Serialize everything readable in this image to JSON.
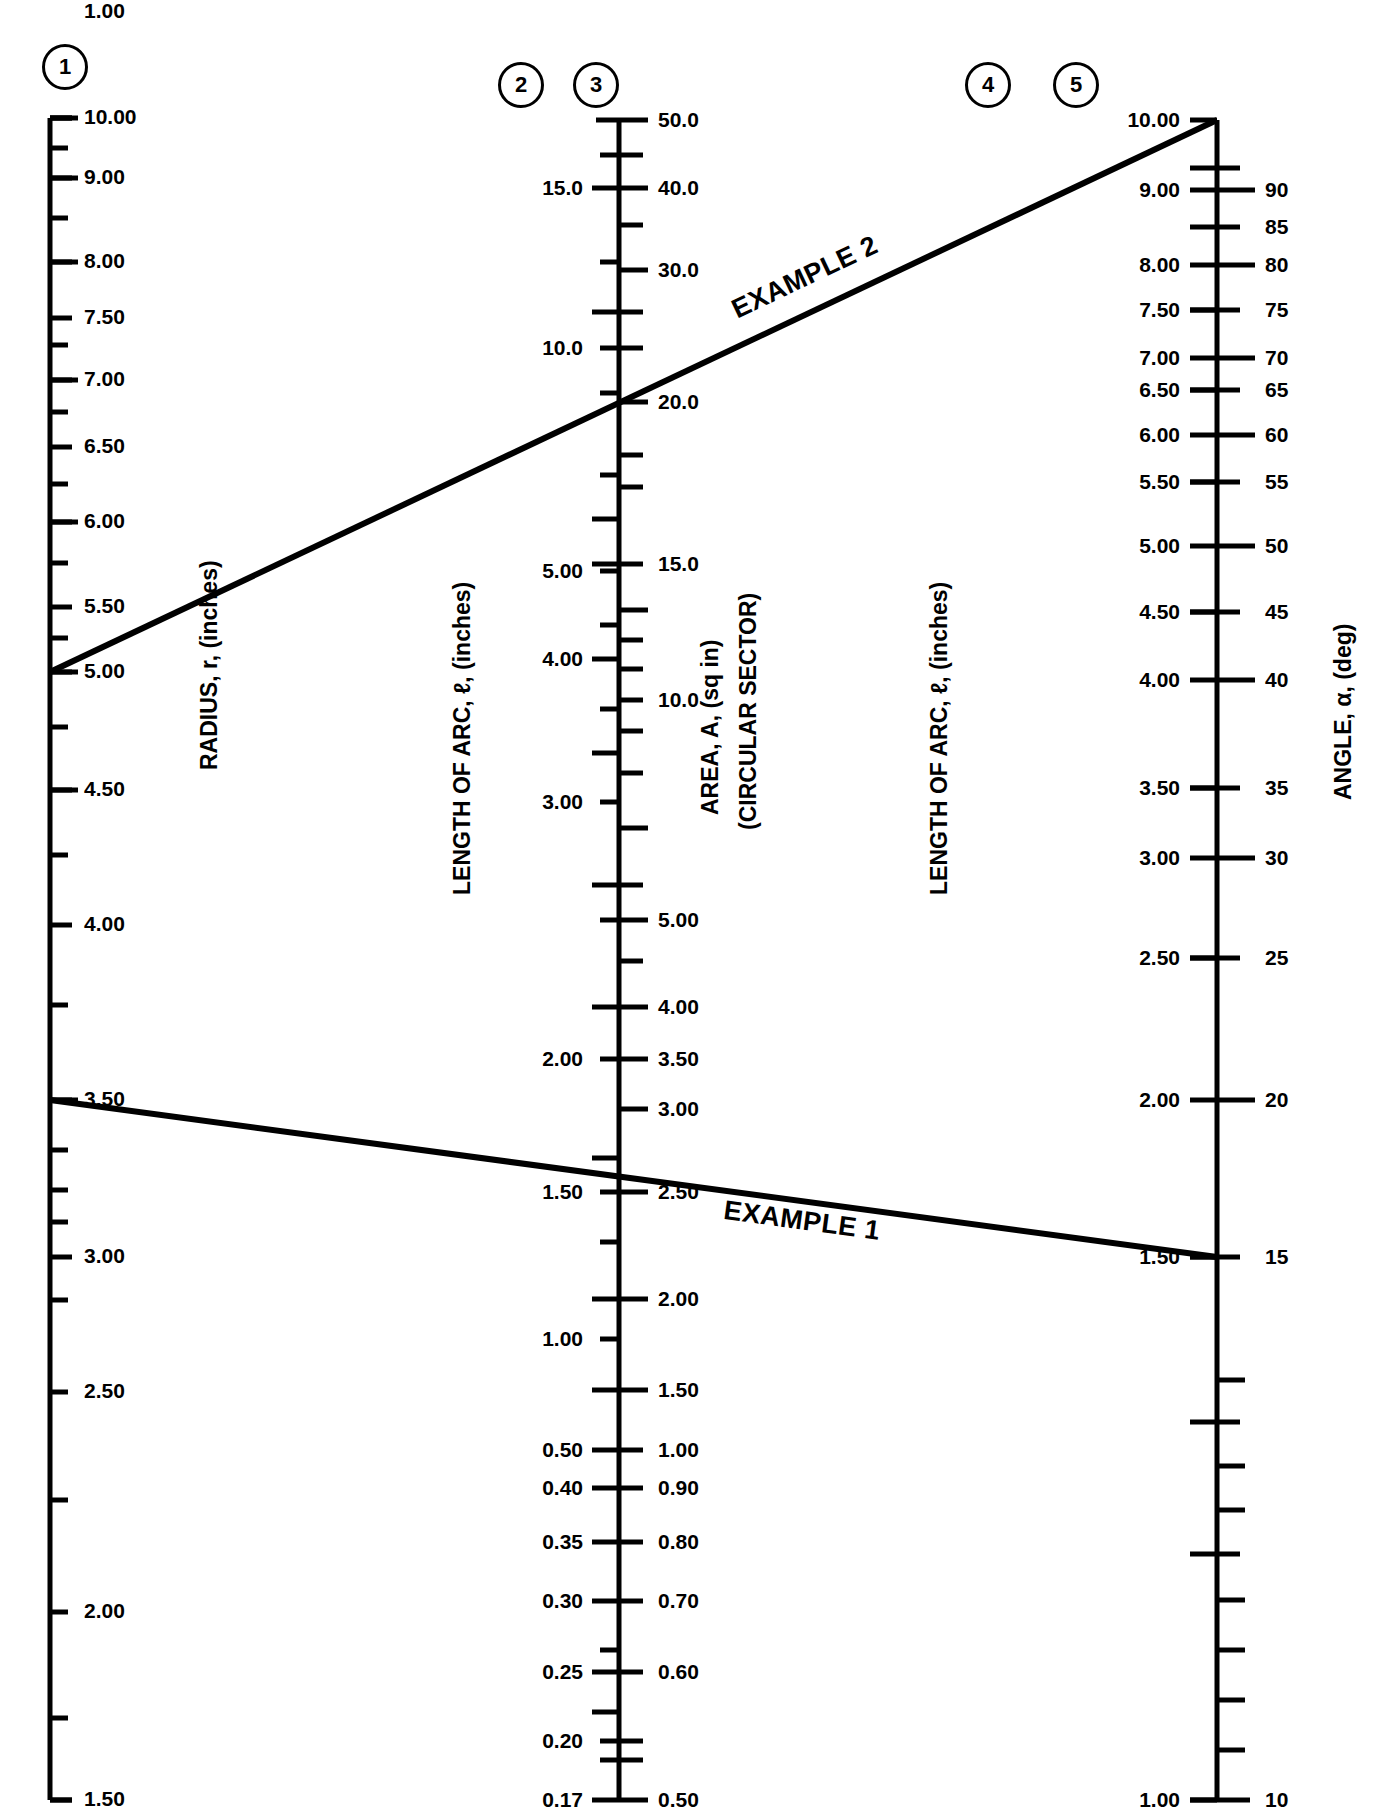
{
  "figure": {
    "type": "nomogram"
  },
  "scale_markers": [
    {
      "id": "1",
      "label": "1"
    },
    {
      "id": "2",
      "label": "2"
    },
    {
      "id": "3",
      "label": "3"
    },
    {
      "id": "4",
      "label": "4"
    },
    {
      "id": "5",
      "label": "5"
    }
  ],
  "axis_titles": {
    "radius": "RADIUS, r, (inches)",
    "arc_left": "LENGTH OF ARC, ℓ, (inches)",
    "area_line1": "AREA, A, (sq in)",
    "area_line2": "(CIRCULAR SECTOR)",
    "arc_right": "LENGTH OF ARC, ℓ, (inches)",
    "angle": "ANGLE, α, (deg)"
  },
  "annotations": [
    {
      "name": "example-2",
      "text": "EXAMPLE 2"
    },
    {
      "name": "example-1",
      "text": "EXAMPLE 1"
    }
  ],
  "chart_data": {
    "type": "nomogram",
    "title": "",
    "scales": [
      {
        "id": 1,
        "name": "RADIUS, r, (inches)",
        "units": "inches",
        "label_side": "right",
        "range": [
          1.0,
          10.0
        ],
        "labeled_ticks": [
          "10.00",
          "9.00",
          "8.00",
          "7.50",
          "7.00",
          "6.50",
          "6.00",
          "5.50",
          "5.00",
          "4.50",
          "4.00",
          "3.50",
          "3.00",
          "2.50",
          "2.00",
          "1.50",
          "1.00"
        ]
      },
      {
        "id": 2,
        "name": "LENGTH OF ARC, ℓ, (inches)",
        "units": "inches",
        "label_side": "left",
        "range": [
          0.17,
          17.0
        ],
        "labeled_ticks": [
          "15.0",
          "10.0",
          "5.00",
          "4.00",
          "3.00",
          "2.00",
          "1.50",
          "1.00",
          "0.50",
          "0.40",
          "0.35",
          "0.30",
          "0.25",
          "0.20",
          "0.17"
        ]
      },
      {
        "id": 3,
        "name": "AREA, A, (sq in) (CIRCULAR SECTOR)",
        "units": "sq in",
        "label_side": "right",
        "range": [
          0.5,
          50.0
        ],
        "labeled_ticks": [
          "50.0",
          "40.0",
          "30.0",
          "20.0",
          "15.0",
          "10.0",
          "5.00",
          "4.00",
          "3.50",
          "3.00",
          "2.50",
          "2.00",
          "1.50",
          "1.00",
          "0.90",
          "0.80",
          "0.70",
          "0.60",
          "0.50"
        ]
      },
      {
        "id": 4,
        "name": "LENGTH OF ARC, ℓ, (inches)",
        "units": "inches",
        "label_side": "left",
        "range": [
          1.0,
          10.0
        ],
        "labeled_ticks": [
          "10.00",
          "9.00",
          "8.00",
          "7.50",
          "7.00",
          "6.50",
          "6.00",
          "5.50",
          "5.00",
          "4.50",
          "4.00",
          "3.50",
          "3.00",
          "2.50",
          "2.00",
          "1.50",
          "1.00"
        ]
      },
      {
        "id": 5,
        "name": "ANGLE, α, (deg)",
        "units": "deg",
        "label_side": "right",
        "range": [
          10,
          90
        ],
        "labeled_ticks": [
          "90",
          "85",
          "80",
          "75",
          "70",
          "65",
          "60",
          "55",
          "50",
          "45",
          "40",
          "35",
          "30",
          "25",
          "20",
          "15",
          "10"
        ]
      }
    ],
    "example_lines": [
      {
        "name": "EXAMPLE 2",
        "from": {
          "scale": 1,
          "value": "4.00"
        },
        "through": {
          "scale": 2,
          "value": "20.0 (area)"
        },
        "to": {
          "scale": 5,
          "value": "10.00 arc"
        }
      },
      {
        "name": "EXAMPLE 1",
        "from": {
          "scale": 1,
          "value": "2.50"
        },
        "through": {
          "scale": 3,
          "value": "2.00 (area)"
        },
        "to": {
          "scale": 4,
          "value": "1.50 arc / 15 deg"
        }
      }
    ]
  },
  "colors": {
    "ink": "#000000",
    "background": "#ffffff"
  }
}
